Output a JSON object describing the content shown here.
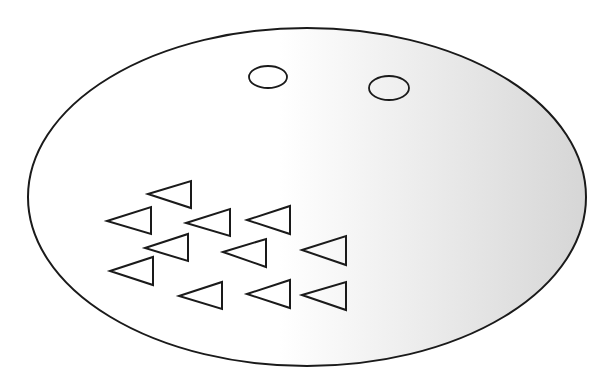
{
  "diagram": {
    "colors": {
      "stroke": "#1a1a1a",
      "fill_light": "#ffffff",
      "fill_dark": "#d6d6d6",
      "background": "#ffffff"
    },
    "outer_ellipse": {
      "cx": 307,
      "cy": 197,
      "rx": 279,
      "ry": 169
    },
    "ovals": [
      {
        "cx": 268,
        "cy": 77,
        "rx": 19,
        "ry": 11
      },
      {
        "cx": 389,
        "cy": 88,
        "rx": 20,
        "ry": 12
      }
    ],
    "triangles": [
      {
        "tip": [
          148,
          194
        ],
        "base_x": 191,
        "base_top": 181,
        "base_bottom": 208
      },
      {
        "tip": [
          107,
          221
        ],
        "base_x": 151,
        "base_top": 207,
        "base_bottom": 234
      },
      {
        "tip": [
          186,
          223
        ],
        "base_x": 230,
        "base_top": 209,
        "base_bottom": 236
      },
      {
        "tip": [
          247,
          220
        ],
        "base_x": 290,
        "base_top": 206,
        "base_bottom": 234
      },
      {
        "tip": [
          145,
          248
        ],
        "base_x": 188,
        "base_top": 234,
        "base_bottom": 261
      },
      {
        "tip": [
          223,
          252
        ],
        "base_x": 266,
        "base_top": 239,
        "base_bottom": 267
      },
      {
        "tip": [
          302,
          250
        ],
        "base_x": 346,
        "base_top": 236,
        "base_bottom": 265
      },
      {
        "tip": [
          110,
          271
        ],
        "base_x": 153,
        "base_top": 257,
        "base_bottom": 285
      },
      {
        "tip": [
          179,
          296
        ],
        "base_x": 222,
        "base_top": 282,
        "base_bottom": 309
      },
      {
        "tip": [
          247,
          294
        ],
        "base_x": 290,
        "base_top": 280,
        "base_bottom": 308
      },
      {
        "tip": [
          302,
          295
        ],
        "base_x": 346,
        "base_top": 282,
        "base_bottom": 310
      }
    ]
  }
}
